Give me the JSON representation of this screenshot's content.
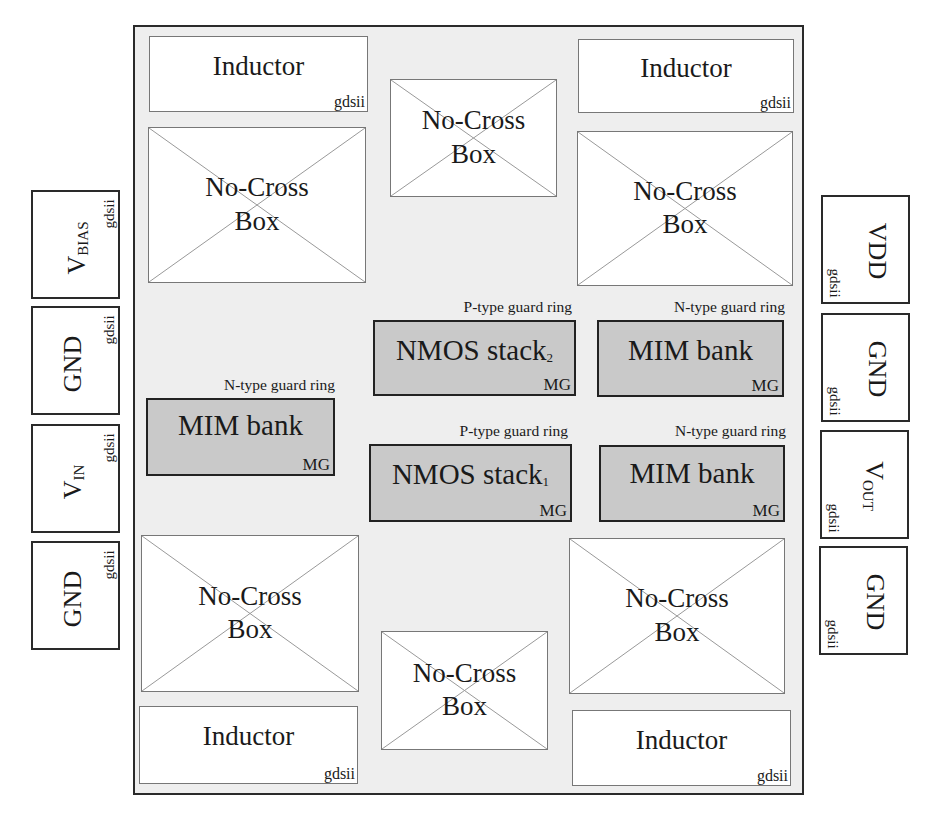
{
  "diagram": {
    "type": "chip floorplan",
    "chip": {
      "inductors": [
        {
          "id": "inductor-top-left",
          "label": "Inductor",
          "tag": "gdsii"
        },
        {
          "id": "inductor-top-right",
          "label": "Inductor",
          "tag": "gdsii"
        },
        {
          "id": "inductor-bottom-left",
          "label": "Inductor",
          "tag": "gdsii"
        },
        {
          "id": "inductor-bottom-right",
          "label": "Inductor",
          "tag": "gdsii"
        }
      ],
      "no_cross_boxes": [
        {
          "id": "ncb-top-left",
          "line1": "No-Cross",
          "line2": "Box"
        },
        {
          "id": "ncb-top-center",
          "line1": "No-Cross",
          "line2": "Box"
        },
        {
          "id": "ncb-top-right",
          "line1": "No-Cross",
          "line2": "Box"
        },
        {
          "id": "ncb-bottom-left",
          "line1": "No-Cross",
          "line2": "Box"
        },
        {
          "id": "ncb-bottom-center",
          "line1": "No-Cross",
          "line2": "Box"
        },
        {
          "id": "ncb-bottom-right",
          "line1": "No-Cross",
          "line2": "Box"
        }
      ],
      "blocks": [
        {
          "id": "nmos-stack-2",
          "label": "NMOS stack",
          "sub": "2",
          "ring": "P-type guard ring",
          "tag": "MG"
        },
        {
          "id": "mim-bank-top-right",
          "label": "MIM bank",
          "sub": "",
          "ring": "N-type guard ring",
          "tag": "MG"
        },
        {
          "id": "mim-bank-left",
          "label": "MIM bank",
          "sub": "",
          "ring": "N-type guard ring",
          "tag": "MG"
        },
        {
          "id": "nmos-stack-1",
          "label": "NMOS stack",
          "sub": "1",
          "ring": "P-type guard ring",
          "tag": "MG"
        },
        {
          "id": "mim-bank-bottom-right",
          "label": "MIM bank",
          "sub": "",
          "ring": "N-type guard ring",
          "tag": "MG"
        }
      ]
    },
    "left_pads": [
      {
        "main": "V",
        "sub": "BIAS",
        "tag": "gdsii"
      },
      {
        "main": "GND",
        "sub": "",
        "tag": "gdsii"
      },
      {
        "main": "V",
        "sub": "IN",
        "tag": "gdsii"
      },
      {
        "main": "GND",
        "sub": "",
        "tag": "gdsii"
      }
    ],
    "right_pads": [
      {
        "main": "VDD",
        "sub": "",
        "tag": "gdsii"
      },
      {
        "main": "GND",
        "sub": "",
        "tag": "gdsii"
      },
      {
        "main": "V",
        "sub": "OUT",
        "tag": "gdsii"
      },
      {
        "main": "GND",
        "sub": "",
        "tag": "gdsii"
      }
    ],
    "colors": {
      "chip_fill": "#eeeeee",
      "block_fill": "#c9c9c9",
      "cross_line": "#999999",
      "border": "#222222"
    }
  }
}
